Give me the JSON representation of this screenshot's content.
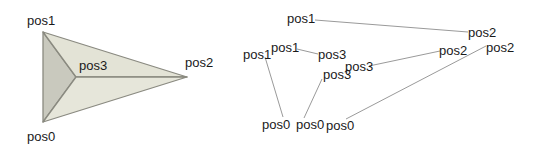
{
  "left_figure": {
    "vertices": {
      "pos0": {
        "x": 43,
        "y": 122,
        "label": "pos0",
        "lx": 27,
        "ly": 141
      },
      "pos1": {
        "x": 43,
        "y": 32,
        "label": "pos1",
        "lx": 27,
        "ly": 25
      },
      "pos2": {
        "x": 187,
        "y": 77,
        "label": "pos2",
        "lx": 185,
        "ly": 67
      },
      "pos3": {
        "x": 76,
        "y": 77,
        "label": "pos3",
        "lx": 79,
        "ly": 70
      }
    },
    "faces": [
      {
        "name": "left-face",
        "points": [
          "pos1",
          "pos3",
          "pos0"
        ],
        "fill": "#c9c9be"
      },
      {
        "name": "top-face",
        "points": [
          "pos1",
          "pos2",
          "pos3"
        ],
        "fill": "#e3e3d6"
      },
      {
        "name": "bottom-face",
        "points": [
          "pos3",
          "pos2",
          "pos0"
        ],
        "fill": "#e6e6da"
      }
    ],
    "edge_color": "#8a8a80"
  },
  "right_figure": {
    "line_color": "#9a9a9a",
    "segments": [
      {
        "a": {
          "label": "pos1",
          "lx": 287,
          "ly": 23,
          "x": 315,
          "y": 20
        },
        "b": {
          "label": "pos2",
          "lx": 468,
          "ly": 37,
          "x": 468,
          "y": 32
        }
      },
      {
        "a": {
          "label": "pos1",
          "lx": 271,
          "ly": 52,
          "x": 297,
          "y": 49
        },
        "b": {
          "label": "pos3",
          "lx": 318,
          "ly": 59,
          "x": 318,
          "y": 54
        }
      },
      {
        "a": {
          "label": "pos3",
          "lx": 345,
          "ly": 71,
          "x": 369,
          "y": 66
        },
        "b": {
          "label": "pos2",
          "lx": 439,
          "ly": 55,
          "x": 440,
          "y": 51
        }
      },
      {
        "a": {
          "label": "pos1",
          "lx": 243,
          "ly": 59,
          "x": 265,
          "y": 57
        },
        "b": {
          "label": "pos0",
          "lx": 262,
          "ly": 129,
          "x": 283,
          "y": 117
        }
      },
      {
        "a": {
          "label": "pos3",
          "lx": 323,
          "ly": 79,
          "x": 322,
          "y": 79
        },
        "b": {
          "label": "pos0",
          "lx": 296,
          "ly": 129,
          "x": 304,
          "y": 118
        }
      },
      {
        "a": {
          "label": "pos0",
          "lx": 326,
          "ly": 130,
          "x": 346,
          "y": 119
        },
        "b": {
          "label": "pos2",
          "lx": 486,
          "ly": 52,
          "x": 486,
          "y": 46
        }
      }
    ]
  }
}
